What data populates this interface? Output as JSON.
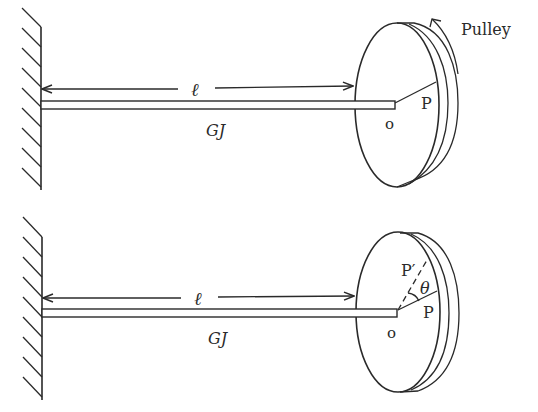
{
  "figure": {
    "colors": {
      "ink": "#2a2a2a",
      "background": "#ffffff"
    },
    "top_panel": {
      "length_label": "ℓ",
      "rigidity_label": "GJ",
      "center_label": "o",
      "point_label": "P",
      "pulley_label": "Pulley",
      "rotation_arrow": "counterclockwise-arrow"
    },
    "bottom_panel": {
      "length_label": "ℓ",
      "rigidity_label": "GJ",
      "center_label": "o",
      "point_label": "P",
      "rotated_point_label": "P′",
      "angle_label": "θ"
    }
  }
}
